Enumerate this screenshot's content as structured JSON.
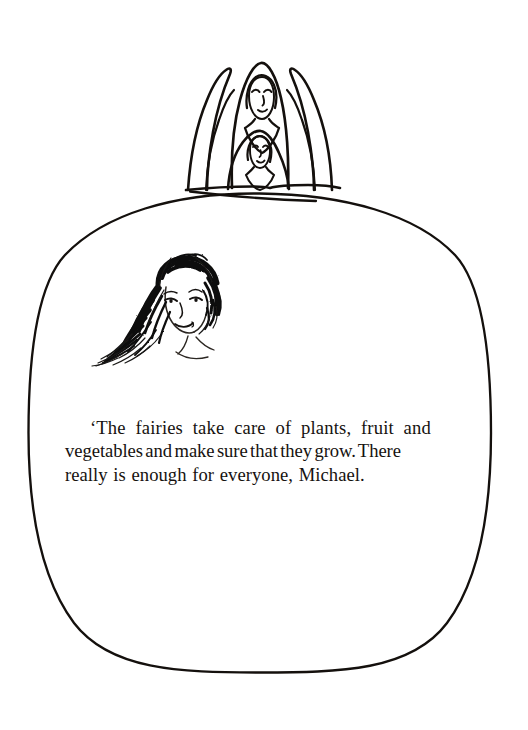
{
  "page": {
    "background_color": "#ffffff",
    "ink_color": "#16120f",
    "width": 528,
    "height": 730
  },
  "illustration": {
    "frame": {
      "shape_name": "oval-frame",
      "description": "large hand-drawn oval outline enclosing the text",
      "stroke_color": "#14100d"
    },
    "top_scene": {
      "name": "fairies-on-hilltop",
      "description": "two hooded fairy figures seated on a hilltop between upswept wing shapes, drawn in black outline",
      "figures": [
        {
          "name": "tall-hooded-fairy",
          "description": "taller hooded figure with face, eyes, nose and mouth"
        },
        {
          "name": "small-hooded-fairy",
          "description": "smaller hooded figure below with round face"
        }
      ],
      "wings": [
        {
          "name": "left-wing",
          "description": "upswept pointed wing on the left"
        },
        {
          "name": "right-wing",
          "description": "upswept pointed wing on the right"
        }
      ],
      "ground": {
        "name": "hill-ridge-line",
        "description": "horizontal ground line along the top of the oval"
      }
    },
    "portrait": {
      "name": "girl-portrait-sketch",
      "description": "scratchy pen-and-ink sketch of a girl's face with long wavy hair, inside the oval above the text"
    }
  },
  "text": {
    "passage_lines": [
      "‘The fairies take care of plants, fruit and",
      "vegetables and make sure that they grow. There",
      "really is enough for everyone, Michael."
    ],
    "full_passage": "‘The fairies take care of plants, fruit and vegetables and make sure that they grow. There really is enough for everyone, Michael."
  }
}
